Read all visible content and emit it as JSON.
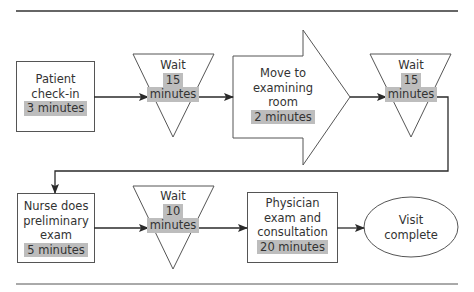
{
  "diagram": {
    "type": "process-flow",
    "colors": {
      "stroke": "#3a3a3a",
      "highlight": "#bdbdbd",
      "text": "#333333",
      "background": "#ffffff"
    },
    "nodes": [
      {
        "id": "checkin",
        "shape": "rectangle",
        "lines": [
          "Patient",
          "check-in"
        ],
        "duration": "3 minutes"
      },
      {
        "id": "wait1",
        "shape": "inverted-triangle",
        "lines": [
          "Wait"
        ],
        "duration_lines": [
          "15",
          "minutes"
        ]
      },
      {
        "id": "move",
        "shape": "block-arrow",
        "lines": [
          "Move to",
          "examining",
          "room"
        ],
        "duration": "2 minutes"
      },
      {
        "id": "wait2",
        "shape": "inverted-triangle",
        "lines": [
          "Wait"
        ],
        "duration_lines": [
          "15",
          "minutes"
        ]
      },
      {
        "id": "nurse",
        "shape": "rectangle",
        "lines": [
          "Nurse does",
          "preliminary",
          "exam"
        ],
        "duration": "5 minutes"
      },
      {
        "id": "wait3",
        "shape": "inverted-triangle",
        "lines": [
          "Wait"
        ],
        "duration_lines": [
          "10",
          "minutes"
        ]
      },
      {
        "id": "physician",
        "shape": "rectangle",
        "lines": [
          "Physician",
          "exam and",
          "consultation"
        ],
        "duration": "20 minutes"
      },
      {
        "id": "complete",
        "shape": "ellipse",
        "lines": [
          "Visit",
          "complete"
        ]
      }
    ],
    "edges": [
      [
        "checkin",
        "wait1"
      ],
      [
        "wait1",
        "move"
      ],
      [
        "move",
        "wait2"
      ],
      [
        "wait2",
        "nurse"
      ],
      [
        "nurse",
        "wait3"
      ],
      [
        "wait3",
        "physician"
      ],
      [
        "physician",
        "complete"
      ]
    ]
  }
}
